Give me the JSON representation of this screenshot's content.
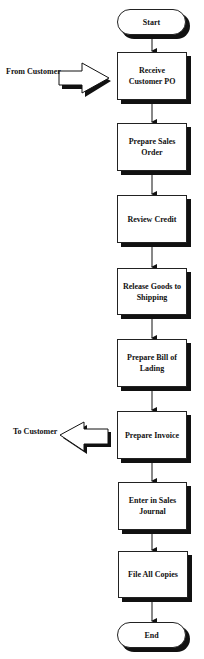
{
  "diagram": {
    "type": "flowchart",
    "title": "",
    "nodes": [
      {
        "id": "start",
        "shape": "terminal",
        "label": "Start"
      },
      {
        "id": "n1",
        "shape": "process",
        "label": "Receive Customer PO"
      },
      {
        "id": "n2",
        "shape": "process",
        "label": "Prepare Sales Order"
      },
      {
        "id": "n3",
        "shape": "process",
        "label": "Review Credit"
      },
      {
        "id": "n4",
        "shape": "process",
        "label": "Release Goods to Shipping"
      },
      {
        "id": "n5",
        "shape": "process",
        "label": "Prepare Bill of Lading"
      },
      {
        "id": "n6",
        "shape": "process",
        "label": "Prepare Invoice"
      },
      {
        "id": "n7",
        "shape": "process",
        "label": "Enter in Sales Journal"
      },
      {
        "id": "n8",
        "shape": "process",
        "label": "File All Copies"
      },
      {
        "id": "end",
        "shape": "terminal",
        "label": "End"
      }
    ],
    "edges": [
      {
        "from": "start",
        "to": "n1"
      },
      {
        "from": "n1",
        "to": "n2"
      },
      {
        "from": "n2",
        "to": "n3"
      },
      {
        "from": "n3",
        "to": "n4"
      },
      {
        "from": "n4",
        "to": "n5"
      },
      {
        "from": "n5",
        "to": "n6"
      },
      {
        "from": "n6",
        "to": "n7"
      },
      {
        "from": "n7",
        "to": "n8"
      },
      {
        "from": "n8",
        "to": "end"
      }
    ],
    "external_flows": [
      {
        "direction": "in",
        "label": "From Customer",
        "target": "n1"
      },
      {
        "direction": "out",
        "label": "To Customer",
        "source": "n6"
      }
    ]
  }
}
